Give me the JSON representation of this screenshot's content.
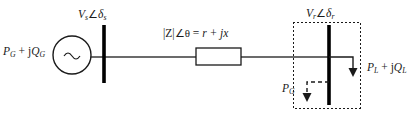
{
  "diagram": {
    "background_color": "#ffffff",
    "line_color": "#1a1a1a",
    "text_color": "#1a1a1a",
    "labels": {
      "source_injection": {
        "main": "P",
        "sub1": "G",
        "op": " + j",
        "main2": "Q",
        "sub2": "G",
        "full": "P_G + jQ_G"
      },
      "sending_bus": {
        "main": "V",
        "sub1": "s",
        "angle": "∠",
        "main2": "δ",
        "sub2": "s",
        "full": "V_s ∠δ_s"
      },
      "impedance": {
        "magnitude": "|Z|",
        "angle": "∠θ",
        "equals": " = ",
        "rect": "r + jx",
        "full": "|Z|∠θ = r + jx"
      },
      "receiving_bus": {
        "main": "V",
        "sub1": "r",
        "angle": "∠",
        "main2": "δ",
        "sub2": "r",
        "full": "V_r ∠δ_r"
      },
      "load": {
        "main": "P",
        "sub1": "L",
        "op": " + j",
        "main2": "Q",
        "sub2": "L",
        "full": "P_L + jQ_L"
      },
      "embedded_generation": {
        "main": "P",
        "sub1": "G",
        "full": "P_G"
      }
    },
    "elements": {
      "generator": {
        "name": "ac-source",
        "symbol": "~",
        "cx": 72,
        "cy": 55,
        "r": 19
      },
      "sending_busbar": {
        "x": 104,
        "y1": 25,
        "y2": 83
      },
      "receiving_busbar": {
        "x": 329,
        "y1": 25,
        "y2": 105
      },
      "impedance_block": {
        "x": 196,
        "y": 48,
        "w": 45,
        "h": 17
      },
      "dashed_boundary": {
        "x": 293,
        "y": 22,
        "w": 67,
        "h": 86
      },
      "load_arrow": {
        "from_x": 329,
        "to_x": 353,
        "y": 57,
        "tip_y": 76
      },
      "generation_arrow": {
        "from_x": 329,
        "to_x": 307,
        "y": 82,
        "tip_y": 101,
        "style": "dashed"
      },
      "tie_line": {
        "x1": 104,
        "x2": 329,
        "y": 57
      }
    }
  }
}
